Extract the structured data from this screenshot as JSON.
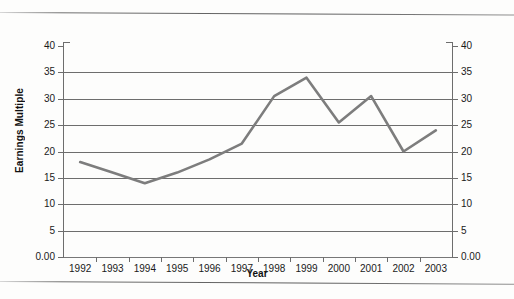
{
  "chart_data": {
    "type": "line",
    "title": "",
    "xlabel": "Year",
    "ylabel": "Earnings Multiple",
    "categories": [
      "1992",
      "1993",
      "1994",
      "1995",
      "1996",
      "1997",
      "1998",
      "1999",
      "2000",
      "2001",
      "2002",
      "2003"
    ],
    "values": [
      18,
      16,
      14,
      16,
      18.5,
      21.5,
      30.5,
      34,
      25.5,
      30.5,
      20,
      24
    ],
    "series": [
      {
        "name": "Earnings Multiple",
        "values": [
          18,
          16,
          14,
          16,
          18.5,
          21.5,
          30.5,
          34,
          25.5,
          30.5,
          20,
          24
        ],
        "color": "#7d7d7d"
      }
    ],
    "ylim": [
      0,
      40
    ],
    "y_ticks": [
      0,
      5,
      10,
      15,
      20,
      25,
      30,
      35,
      40
    ],
    "y_tick_labels_left": [
      "0.00",
      "5",
      "10",
      "15",
      "20",
      "25",
      "30",
      "35",
      "40"
    ],
    "y_tick_labels_right": [
      "0.00",
      "5",
      "10",
      "15",
      "20",
      "25",
      "30",
      "35",
      "40"
    ],
    "grid": true,
    "grid_axis": "y",
    "legend": false,
    "legend_position": "none",
    "line_color": "#7d7d7d",
    "grid_color": "#6d6d6d",
    "axis_color": "#6d6d6d",
    "background": "#fdfdfc"
  },
  "axis_titles": {
    "x": "Year",
    "y": "Earnings Multiple"
  }
}
